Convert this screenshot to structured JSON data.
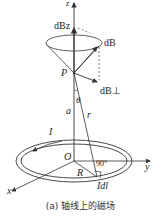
{
  "figure": {
    "caption": "(a) 轴线上的磁场",
    "labels": {
      "z_axis": "z",
      "y_axis": "y",
      "x_axis": "x",
      "dBz": "dBz",
      "dB": "dB",
      "dBperp": "dB⊥",
      "point_P": "P",
      "theta": "θ",
      "a": "a",
      "r": "r",
      "current": "I",
      "origin": "O",
      "radius": "R",
      "right_angle": "90°",
      "Idl": "Idl"
    },
    "colors": {
      "line": "#333333",
      "background": "#ffffff"
    }
  }
}
